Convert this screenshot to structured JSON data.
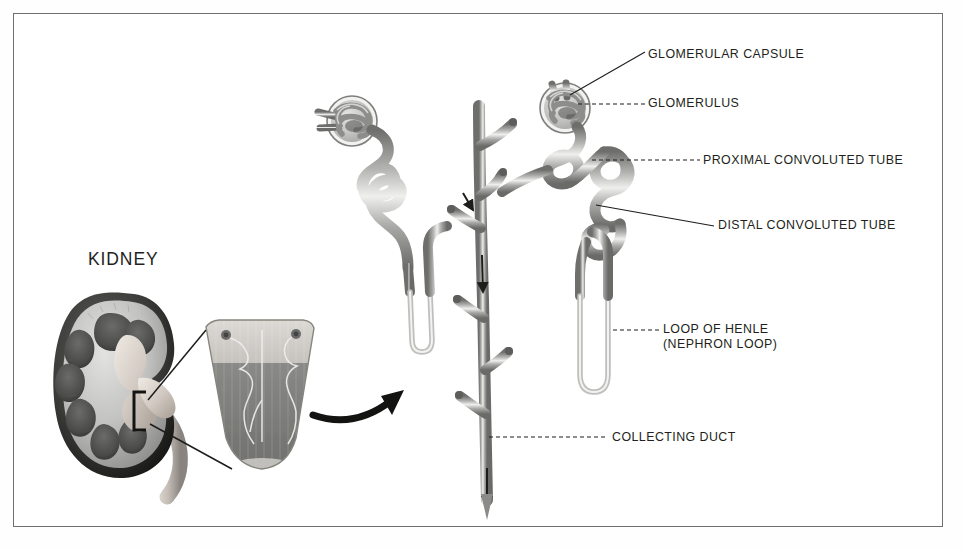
{
  "figure": {
    "background_color": "#ffffff",
    "frame_color": "#70706e",
    "ink_color": "#231f20",
    "tube_color": "#9a9a99",
    "tube_highlight": "#e8e8e7"
  },
  "kidney_section": {
    "heading": "KIDNEY",
    "parts": [
      "renal capsule",
      "cortex",
      "renal pyramid",
      "renal pelvis",
      "ureter"
    ],
    "callout_bracket": "[",
    "arrow_icon": "curved-arrow-icon"
  },
  "labels": [
    {
      "id": "glomerular-capsule",
      "text": "GLOMERULAR CAPSULE",
      "x": 648,
      "y": 55,
      "line_style": "solid"
    },
    {
      "id": "glomerulus",
      "text": "GLOMERULUS",
      "x": 648,
      "y": 101,
      "line_style": "dashed"
    },
    {
      "id": "proximal-convoluted-tube",
      "text": "PROXIMAL CONVOLUTED TUBE",
      "x": 703,
      "y": 160,
      "line_style": "dashed"
    },
    {
      "id": "distal-convoluted-tube",
      "text": "DISTAL CONVOLUTED TUBE",
      "x": 718,
      "y": 220,
      "line_style": "solid"
    },
    {
      "id": "loop-of-henle",
      "text": "LOOP OF HENLE",
      "x": 663,
      "y": 325,
      "line_style": "dashed"
    },
    {
      "id": "loop-of-henle-alt",
      "text": "(NEPHRON LOOP)",
      "x": 663,
      "y": 340,
      "line_style": "none"
    },
    {
      "id": "collecting-duct",
      "text": "COLLECTING DUCT",
      "x": 612,
      "y": 437,
      "line_style": "dashed"
    }
  ],
  "nephrons": [
    {
      "id": "nephron-left",
      "glomerulus_at": [
        353,
        120
      ]
    },
    {
      "id": "nephron-right",
      "glomerulus_at": [
        565,
        107
      ]
    }
  ],
  "collecting_duct": {
    "id": "collecting-duct-trunk",
    "top": [
      479,
      105
    ],
    "bottom": [
      487,
      520
    ],
    "flow_arrows": 3
  }
}
